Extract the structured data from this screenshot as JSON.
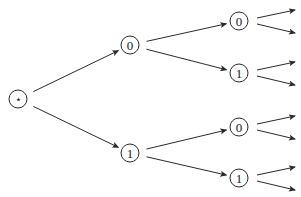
{
  "diagram": {
    "type": "binary-tree",
    "root": {
      "id": "root",
      "label": "⋆",
      "x": 18,
      "y": 99
    },
    "nodes": [
      {
        "id": "n0",
        "label": "0",
        "x": 130,
        "y": 45,
        "parent": "root"
      },
      {
        "id": "n1",
        "label": "1",
        "x": 130,
        "y": 153,
        "parent": "root"
      },
      {
        "id": "n00",
        "label": "0",
        "x": 239,
        "y": 21,
        "parent": "n0"
      },
      {
        "id": "n01",
        "label": "1",
        "x": 239,
        "y": 73,
        "parent": "n0"
      },
      {
        "id": "n10",
        "label": "0",
        "x": 239,
        "y": 127,
        "parent": "n1"
      },
      {
        "id": "n11",
        "label": "1",
        "x": 239,
        "y": 178,
        "parent": "n1"
      }
    ],
    "leaf_arrows_per_node": 2,
    "node_radius": 9,
    "colors": {
      "stroke": "#2a2a2a",
      "background": "#ffffff",
      "text": "#1a1a1a"
    }
  }
}
